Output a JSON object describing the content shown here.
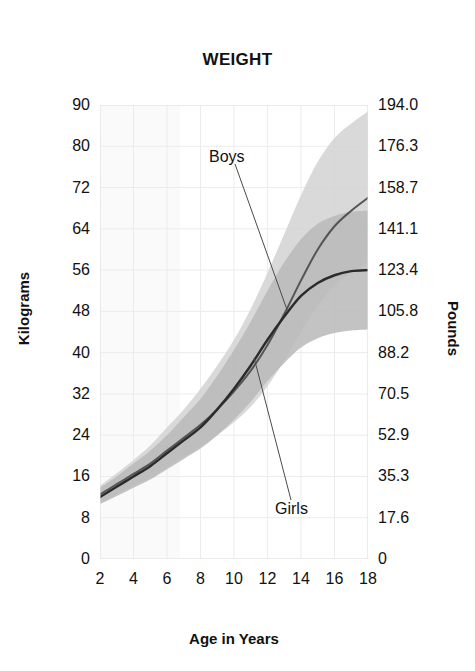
{
  "chart_data": {
    "type": "line",
    "title": "WEIGHT",
    "xlabel": "Age in Years",
    "ylabel": "Kilograms",
    "ylabel_right": "Pounds",
    "xlim": [
      2,
      18
    ],
    "ylim": [
      0,
      90
    ],
    "ylim_right": [
      0,
      194.0
    ],
    "grid": true,
    "legend_position": "inline-annotations",
    "x_ticks": [
      "2",
      "4",
      "6",
      "8",
      "10",
      "12",
      "14",
      "16",
      "18"
    ],
    "y_ticks_left": [
      "0",
      "8",
      "16",
      "24",
      "32",
      "40",
      "48",
      "56",
      "64",
      "72",
      "80",
      "90"
    ],
    "y_ticks_right": [
      "0",
      "17.6",
      "35.3",
      "52.9",
      "70.5",
      "88.2",
      "105.8",
      "123.4",
      "141.1",
      "158.7",
      "176.3",
      "194.0"
    ],
    "x": [
      2,
      3,
      4,
      5,
      6,
      7,
      8,
      9,
      10,
      11,
      12,
      13,
      14,
      15,
      16,
      17,
      18
    ],
    "series": [
      {
        "name": "Boys",
        "label": "Boys",
        "color": "#555555",
        "values": [
          12.5,
          14.5,
          16.5,
          18.5,
          21.0,
          23.5,
          26.0,
          29.0,
          32.5,
          36.5,
          41.5,
          47.5,
          54.0,
          60.0,
          64.5,
          67.5,
          70.0
        ],
        "band_name": "Boys range",
        "band_color": "#d2d2d2",
        "band_lower": [
          11.0,
          12.6,
          14.2,
          15.8,
          17.8,
          19.8,
          21.8,
          24.0,
          26.5,
          29.5,
          33.5,
          38.5,
          44.0,
          49.0,
          53.0,
          55.5,
          57.5
        ],
        "band_upper": [
          14.2,
          16.6,
          19.2,
          22.0,
          25.5,
          29.0,
          33.0,
          37.5,
          42.5,
          48.5,
          55.5,
          63.0,
          70.5,
          77.0,
          82.0,
          85.5,
          88.5
        ]
      },
      {
        "name": "Girls",
        "label": "Girls",
        "color": "#2b2b2b",
        "values": [
          12.0,
          14.0,
          16.0,
          18.0,
          20.5,
          23.0,
          25.5,
          29.0,
          33.0,
          37.5,
          42.5,
          47.0,
          51.0,
          53.5,
          55.0,
          55.8,
          56.0
        ],
        "band_name": "Girls range",
        "band_color": "#b9b9b9",
        "band_lower": [
          10.6,
          12.2,
          13.8,
          15.4,
          17.4,
          19.4,
          21.4,
          24.0,
          27.0,
          30.5,
          34.5,
          38.0,
          41.0,
          42.8,
          43.8,
          44.3,
          44.5
        ],
        "band_upper": [
          13.8,
          16.0,
          18.5,
          21.0,
          24.0,
          27.5,
          31.0,
          35.5,
          40.5,
          46.0,
          52.0,
          57.5,
          62.0,
          65.0,
          66.5,
          67.3,
          67.5
        ]
      }
    ],
    "annotations": [
      {
        "name": "boys-annotation",
        "text": "Boys",
        "target_x": 13.2,
        "target_y": 48.0
      },
      {
        "name": "girls-annotation",
        "text": "Girls",
        "target_x": 11.2,
        "target_y": 39.0
      }
    ]
  }
}
